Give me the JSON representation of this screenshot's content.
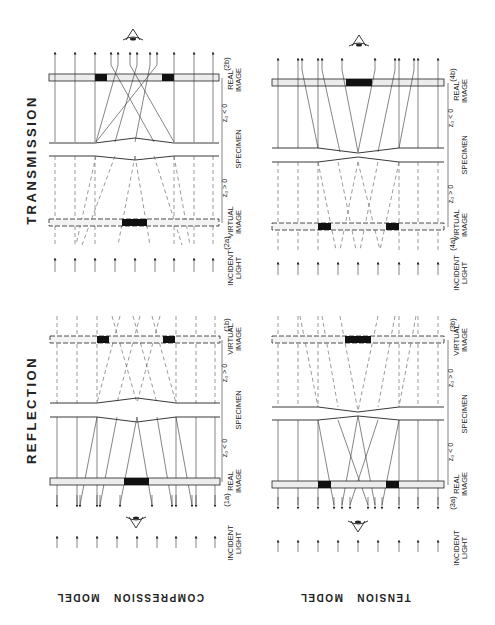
{
  "figure": {
    "orientation": "rotated-90-ccw",
    "columns": [
      {
        "title": "TRANSMISSION"
      },
      {
        "title": "REFLECTION"
      }
    ],
    "rows": [
      {
        "model_label": "COMPRESSION   MODEL"
      },
      {
        "model_label": "TENSION   MODEL"
      }
    ],
    "panels": {
      "trans_compression": {
        "real_image_tag": "(2b)",
        "virtual_image_tag": "(2a)",
        "labels": {
          "real_image": [
            "REAL",
            "IMAGE"
          ],
          "z_neg": "z₀ < 0",
          "specimen": "SPECIMEN",
          "z_pos": "z₀ > 0",
          "virtual_image": [
            "VIRTUAL",
            "IMAGE"
          ],
          "incident": [
            "INCIDENT",
            "LIGHT"
          ]
        }
      },
      "trans_tension": {
        "real_image_tag": "(4b)",
        "virtual_image_tag": "(4a)",
        "labels": {
          "real_image": [
            "REAL",
            "IMAGE"
          ],
          "z_neg": "z₀ < 0",
          "specimen": "SPECIMEN",
          "z_pos": "z₀ > 0",
          "virtual_image": [
            "VIRTUAL",
            "IMAGE"
          ],
          "incident": [
            "INCIDENT",
            "LIGHT"
          ]
        }
      },
      "refl_compression": {
        "virtual_image_tag": "(1b)",
        "real_image_tag": "(1a)",
        "labels": {
          "virtual_image": [
            "VIRTUAL",
            "IMAGE"
          ],
          "z_pos": "z₀ > 0",
          "specimen": "SPECIMEN",
          "z_neg": "z₀ < 0",
          "real_image": [
            "REAL",
            "IMAGE"
          ],
          "incident": [
            "INCIDENT",
            "LIGHT"
          ]
        }
      },
      "refl_tension": {
        "virtual_image_tag": "(3b)",
        "real_image_tag": "(3a)",
        "labels": {
          "virtual_image": [
            "VIRTUAL",
            "IMAGE"
          ],
          "z_pos": "z₀ > 0",
          "specimen": "SPECIMEN",
          "z_neg": "z₀ < 0",
          "real_image": [
            "REAL",
            "IMAGE"
          ],
          "incident": [
            "INCIDENT",
            "LIGHT"
          ]
        }
      }
    },
    "icons": {
      "observer": "eye-icon",
      "ray_arrow": "arrow-up-icon"
    },
    "colors": {
      "ink": "#222222",
      "paper": "#ffffff",
      "plate_fill": "#ececec",
      "dark_spot": "#111111"
    }
  }
}
